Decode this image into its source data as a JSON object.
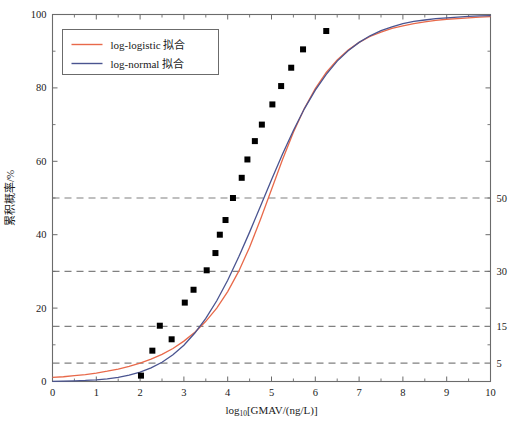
{
  "chart_data": {
    "type": "scatter",
    "title": "",
    "xlabel": "log10[GMAV/(ng/L)]",
    "xlabel_base": "log",
    "xlabel_sub": "10",
    "xlabel_rest": "[GMAV/(ng/L)]",
    "ylabel": "累积概率/%",
    "xlim": [
      0,
      10
    ],
    "ylim": [
      0,
      100
    ],
    "x_ticks": [
      0,
      1,
      2,
      3,
      4,
      5,
      6,
      7,
      8,
      9,
      10
    ],
    "x_tick_labels": [
      "0",
      "1",
      "2",
      "3",
      "4",
      "5",
      "6",
      "7",
      "8",
      "9",
      "10"
    ],
    "x_minor_step": 0.5,
    "y_ticks": [
      0,
      20,
      40,
      60,
      80,
      100
    ],
    "y_tick_labels": [
      "0",
      "20",
      "40",
      "60",
      "80",
      "100"
    ],
    "y_minor_step": 10,
    "grid": true,
    "gridlines": [
      {
        "value": 50,
        "label": "50"
      },
      {
        "value": 30,
        "label": "30"
      },
      {
        "value": 15,
        "label": "15"
      },
      {
        "value": 5,
        "label": "5"
      }
    ],
    "right_axis_labels": [
      "50",
      "30",
      "15",
      "5"
    ],
    "legend_position": "top-left",
    "series": [
      {
        "name": "log-logistic 拟合",
        "kind": "line",
        "color": "#E8694A",
        "model": "log-logistic",
        "params": {
          "mu": 4.05,
          "s": 0.78
        },
        "points": [
          [
            0.0,
            1.1
          ],
          [
            0.25,
            1.3
          ],
          [
            0.5,
            1.6
          ],
          [
            0.75,
            1.9
          ],
          [
            1.0,
            2.3
          ],
          [
            1.25,
            2.8
          ],
          [
            1.5,
            3.4
          ],
          [
            1.75,
            4.1
          ],
          [
            2.0,
            5.0
          ],
          [
            2.25,
            6.1
          ],
          [
            2.5,
            7.4
          ],
          [
            2.75,
            9.0
          ],
          [
            3.0,
            11.0
          ],
          [
            3.25,
            13.4
          ],
          [
            3.5,
            16.4
          ],
          [
            3.75,
            20.0
          ],
          [
            4.0,
            24.5
          ],
          [
            4.25,
            30.0
          ],
          [
            4.5,
            36.6
          ],
          [
            4.75,
            44.2
          ],
          [
            5.0,
            52.3
          ],
          [
            5.25,
            60.4
          ],
          [
            5.5,
            67.9
          ],
          [
            5.75,
            74.4
          ],
          [
            6.0,
            79.8
          ],
          [
            6.25,
            84.2
          ],
          [
            6.5,
            87.6
          ],
          [
            6.75,
            90.3
          ],
          [
            7.0,
            92.4
          ],
          [
            7.25,
            94.0
          ],
          [
            7.5,
            95.2
          ],
          [
            7.75,
            96.2
          ],
          [
            8.0,
            96.9
          ],
          [
            8.25,
            97.5
          ],
          [
            8.5,
            98.0
          ],
          [
            8.75,
            98.4
          ],
          [
            9.0,
            98.7
          ],
          [
            9.25,
            98.9
          ],
          [
            9.5,
            99.1
          ],
          [
            9.75,
            99.3
          ],
          [
            10.0,
            99.4
          ]
        ]
      },
      {
        "name": "log-normal 拟合",
        "kind": "line",
        "color": "#4A5490",
        "model": "log-normal",
        "params": {
          "mu": 4.35,
          "sigma": 1.35
        },
        "points": [
          [
            0.0,
            0.06
          ],
          [
            0.25,
            0.1
          ],
          [
            0.5,
            0.17
          ],
          [
            0.75,
            0.28
          ],
          [
            1.0,
            0.46
          ],
          [
            1.25,
            0.73
          ],
          [
            1.5,
            1.13
          ],
          [
            1.75,
            1.72
          ],
          [
            2.0,
            2.55
          ],
          [
            2.25,
            3.7
          ],
          [
            2.5,
            5.25
          ],
          [
            2.75,
            7.28
          ],
          [
            3.0,
            9.9
          ],
          [
            3.25,
            13.2
          ],
          [
            3.5,
            17.2
          ],
          [
            3.75,
            22.0
          ],
          [
            4.0,
            27.6
          ],
          [
            4.25,
            33.9
          ],
          [
            4.5,
            40.7
          ],
          [
            4.75,
            47.8
          ],
          [
            5.0,
            55.0
          ],
          [
            5.25,
            61.9
          ],
          [
            5.5,
            68.4
          ],
          [
            5.75,
            74.3
          ],
          [
            6.0,
            79.4
          ],
          [
            6.25,
            83.7
          ],
          [
            6.5,
            87.3
          ],
          [
            6.75,
            90.1
          ],
          [
            7.0,
            92.4
          ],
          [
            7.25,
            94.2
          ],
          [
            7.5,
            95.6
          ],
          [
            7.75,
            96.6
          ],
          [
            8.0,
            97.5
          ],
          [
            8.25,
            98.1
          ],
          [
            8.5,
            98.5
          ],
          [
            8.75,
            98.9
          ],
          [
            9.0,
            99.1
          ],
          [
            9.25,
            99.3
          ],
          [
            9.5,
            99.5
          ],
          [
            9.75,
            99.6
          ],
          [
            10.0,
            99.7
          ]
        ]
      },
      {
        "name": "observed",
        "kind": "scatter",
        "color": "#000000",
        "marker": "square",
        "points": [
          [
            2.02,
            1.6
          ],
          [
            2.28,
            8.4
          ],
          [
            2.45,
            15.2
          ],
          [
            2.72,
            11.5
          ],
          [
            3.02,
            21.5
          ],
          [
            3.22,
            25.0
          ],
          [
            3.52,
            30.3
          ],
          [
            3.72,
            35.0
          ],
          [
            3.82,
            40.0
          ],
          [
            3.95,
            44.0
          ],
          [
            4.12,
            50.0
          ],
          [
            4.32,
            55.5
          ],
          [
            4.45,
            60.5
          ],
          [
            4.62,
            65.5
          ],
          [
            4.78,
            70.0
          ],
          [
            5.02,
            75.5
          ],
          [
            5.22,
            80.5
          ],
          [
            5.45,
            85.5
          ],
          [
            5.72,
            90.5
          ],
          [
            6.25,
            95.5
          ]
        ]
      }
    ],
    "legend": [
      {
        "label": "log-logistic 拟合",
        "color": "#E8694A"
      },
      {
        "label": "log-normal 拟合",
        "color": "#4A5490"
      }
    ]
  },
  "colors": {
    "log_logistic": "#E8694A",
    "log_normal": "#4A5490",
    "marker": "#000000",
    "axis": "#6b6b6b",
    "grid": "#808080",
    "background": "#ffffff"
  }
}
